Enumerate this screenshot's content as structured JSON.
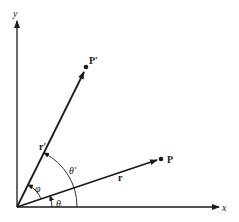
{
  "diagram": {
    "axes": {
      "x_label": "x",
      "y_label": "y"
    },
    "vectors": [
      {
        "id": "r",
        "label": "r",
        "point_label": "P"
      },
      {
        "id": "r_prime",
        "label": "r′",
        "point_label": "P′"
      }
    ],
    "angles": {
      "theta": "θ",
      "theta_prime": "θ′",
      "phi": "φ"
    },
    "colors": {
      "stroke": "#1a1a1a",
      "background": "#ffffff"
    }
  }
}
